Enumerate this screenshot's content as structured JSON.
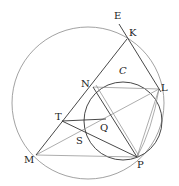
{
  "figure": {
    "title": "",
    "labels": {
      "E": "E",
      "K": "K",
      "N": "N",
      "C": "C",
      "L": "L",
      "T": "T",
      "Q": "Q",
      "S": "S",
      "M": "M",
      "P": "P"
    },
    "colors": {
      "line_dark": "#333333",
      "line_light": "#8a8a8a",
      "circle": "#8a8a8a"
    }
  }
}
